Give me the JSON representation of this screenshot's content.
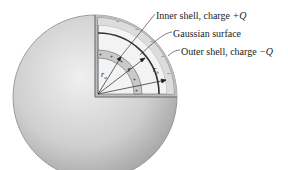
{
  "diagram": {
    "labels": {
      "inner_shell": "Inner shell, charge +Q",
      "inner_shell_text": "Inner shell, charge ",
      "inner_shell_charge": "+Q",
      "gaussian_surface": "Gaussian surface",
      "outer_shell": "Outer shell, charge −Q",
      "outer_shell_text": "Outer shell, charge ",
      "outer_shell_charge": "−Q"
    },
    "radii_labels": {
      "r_a": "r",
      "r_a_sub": "a",
      "r": "r",
      "r_b": "r",
      "r_b_sub": "b"
    },
    "charge_marks": {
      "inner": "+",
      "outer": "−"
    },
    "colors": {
      "sphere_light": "#e6e6e6",
      "sphere_dark": "#9a9a9a",
      "shell_band": "#c8c8c8",
      "interior": "#f2f2f2",
      "line": "#222222"
    }
  }
}
